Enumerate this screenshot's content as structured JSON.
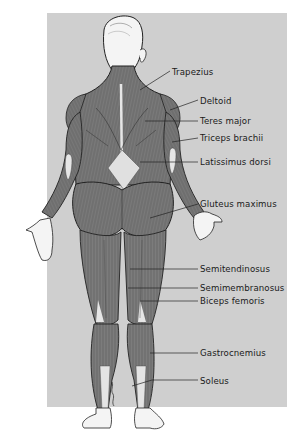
{
  "diagram": {
    "colors": {
      "background": "#ffffff",
      "panel": "#cfcfcf",
      "muscle": "#7a7a7a",
      "muscle_dark": "#5e5e5e",
      "skin": "#f4f4f4",
      "outline": "#222222",
      "tendon": "#e6e6e6"
    },
    "labels": [
      {
        "id": "trapezius",
        "text": "Trapezius",
        "x": 172,
        "y": 67
      },
      {
        "id": "deltoid",
        "text": "Deltoid",
        "x": 200,
        "y": 96
      },
      {
        "id": "teres-major",
        "text": "Teres major",
        "x": 200,
        "y": 116
      },
      {
        "id": "triceps-brachii",
        "text": "Triceps brachii",
        "x": 200,
        "y": 133
      },
      {
        "id": "latissimus-dorsi",
        "text": "Latissimus dorsi",
        "x": 200,
        "y": 157
      },
      {
        "id": "gluteus-maximus",
        "text": "Gluteus maximus",
        "x": 200,
        "y": 199
      },
      {
        "id": "semitendinosus",
        "text": "Semitendinosus",
        "x": 200,
        "y": 264
      },
      {
        "id": "semimembranosus",
        "text": "Semimembranosus",
        "x": 200,
        "y": 283
      },
      {
        "id": "biceps-femoris",
        "text": "Biceps femoris",
        "x": 200,
        "y": 296
      },
      {
        "id": "gastrocnemius",
        "text": "Gastrocnemius",
        "x": 200,
        "y": 348
      },
      {
        "id": "soleus",
        "text": "Soleus",
        "x": 200,
        "y": 376
      }
    ]
  }
}
